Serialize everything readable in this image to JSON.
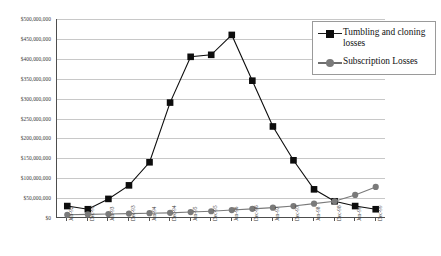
{
  "chart_data": {
    "type": "line",
    "title": "",
    "xlabel": "",
    "ylabel": "",
    "ylim": [
      0,
      500000000
    ],
    "ytick_step": 50000000,
    "grid": true,
    "legend_position": "top-right",
    "categories": [
      "Jun-92",
      "Dec-92",
      "Jun-93",
      "Dec-93",
      "Jun-94",
      "Dec-94",
      "Jun-95",
      "Dec-95",
      "Jun-96",
      "Dec-96",
      "Jun-97",
      "Dec-97",
      "Jun-98",
      "Dec-98",
      "Jun-99",
      "Dec-99"
    ],
    "ytick_labels": [
      "$500,000,000",
      "$450,000,000",
      "$400,000,000",
      "$350,000,000",
      "$300,000,000",
      "$250,000,000",
      "$200,000,000",
      "$150,000,000",
      "$100,000,000",
      "$50,000,000",
      "$0"
    ],
    "ytick_values": [
      500000000,
      450000000,
      400000000,
      350000000,
      300000000,
      250000000,
      200000000,
      150000000,
      100000000,
      50000000,
      0
    ],
    "series": [
      {
        "name": "Tumbling and cloning losses",
        "color": "#0d0d0d",
        "marker": "square",
        "values": [
          30000000,
          22000000,
          48000000,
          82000000,
          140000000,
          290000000,
          405000000,
          410000000,
          460000000,
          345000000,
          230000000,
          145000000,
          72000000,
          42000000,
          30000000,
          22000000
        ]
      },
      {
        "name": "Subscription Losses",
        "color": "#7a7a7a",
        "marker": "circle",
        "values": [
          8000000,
          9000000,
          10000000,
          11000000,
          12000000,
          13000000,
          15000000,
          17000000,
          20000000,
          23000000,
          26000000,
          30000000,
          36000000,
          42000000,
          58000000,
          78000000
        ]
      }
    ]
  },
  "legend": {
    "items": [
      {
        "label": "Tumbling and cloning losses",
        "marker": "square",
        "color": "#0d0d0d"
      },
      {
        "label": "Subscription Losses",
        "marker": "circle",
        "color": "#7a7a7a"
      }
    ]
  },
  "faint_header": ""
}
